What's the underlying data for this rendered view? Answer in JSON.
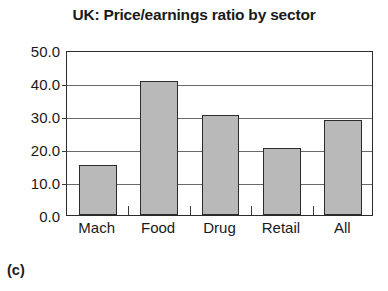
{
  "figure": {
    "caption": "(c)"
  },
  "chart_data": {
    "type": "bar",
    "title": "UK: Price/earnings ratio by sector",
    "xlabel": "",
    "ylabel": "",
    "categories": [
      "Mach",
      "Food",
      "Drug",
      "Retail",
      "All"
    ],
    "values": [
      15.3,
      40.5,
      30.4,
      20.4,
      28.9
    ],
    "ylim": [
      0.0,
      50.0
    ],
    "ytick_labels": [
      "50.0",
      "40.0",
      "30.0",
      "20.0",
      "10.0",
      "0.0"
    ],
    "ytick_values": [
      50.0,
      40.0,
      30.0,
      20.0,
      10.0,
      0.0
    ],
    "grid": true,
    "legend": false,
    "bar_fill_color": "#b9b9b9",
    "bar_edge_color": "#2b2b2b",
    "axis_color": "#2b2b2b",
    "grid_color": "#6a6a6a",
    "background_color": "#ffffff"
  }
}
